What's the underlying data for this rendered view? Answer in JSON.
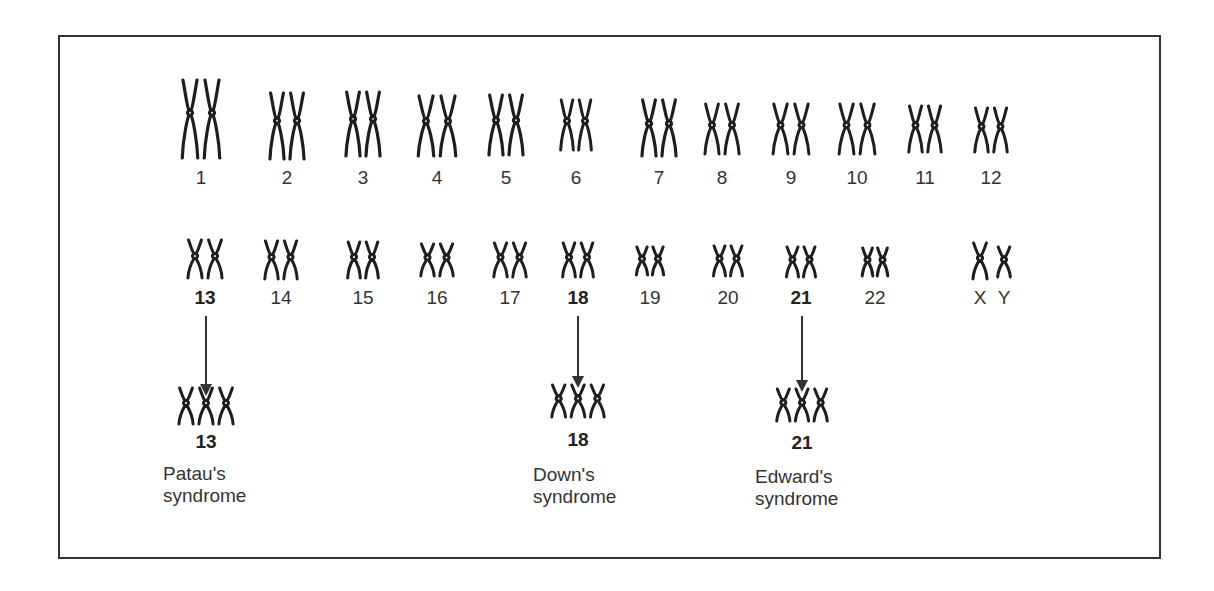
{
  "figure": {
    "row1": [
      {
        "label": "1",
        "x": 201,
        "top": 80,
        "h": 78,
        "w": 44
      },
      {
        "label": "2",
        "x": 287,
        "top": 93,
        "h": 66,
        "w": 40
      },
      {
        "label": "3",
        "x": 363,
        "top": 92,
        "h": 64,
        "w": 40
      },
      {
        "label": "4",
        "x": 437,
        "top": 96,
        "h": 60,
        "w": 44
      },
      {
        "label": "5",
        "x": 506,
        "top": 95,
        "h": 60,
        "w": 40
      },
      {
        "label": "6",
        "x": 576,
        "top": 100,
        "h": 50,
        "w": 36
      },
      {
        "label": "7",
        "x": 659,
        "top": 100,
        "h": 56,
        "w": 40
      },
      {
        "label": "8",
        "x": 722,
        "top": 104,
        "h": 50,
        "w": 40
      },
      {
        "label": "9",
        "x": 791,
        "top": 104,
        "h": 50,
        "w": 42
      },
      {
        "label": "10",
        "x": 857,
        "top": 104,
        "h": 50,
        "w": 42
      },
      {
        "label": "11",
        "x": 925,
        "top": 106,
        "h": 46,
        "w": 38
      },
      {
        "label": "12",
        "x": 991,
        "top": 108,
        "h": 44,
        "w": 38
      }
    ],
    "row1_label_y": 168,
    "row2": [
      {
        "label": "13",
        "x": 205,
        "top": 240,
        "h": 38,
        "w": 40,
        "bold": true
      },
      {
        "label": "14",
        "x": 281,
        "top": 241,
        "h": 38,
        "w": 38,
        "bold": false
      },
      {
        "label": "15",
        "x": 363,
        "top": 242,
        "h": 36,
        "w": 36,
        "bold": false
      },
      {
        "label": "16",
        "x": 437,
        "top": 244,
        "h": 32,
        "w": 38,
        "bold": false
      },
      {
        "label": "17",
        "x": 510,
        "top": 243,
        "h": 34,
        "w": 38,
        "bold": false
      },
      {
        "label": "18",
        "x": 578,
        "top": 243,
        "h": 34,
        "w": 36,
        "bold": true
      },
      {
        "label": "19",
        "x": 650,
        "top": 247,
        "h": 28,
        "w": 32,
        "bold": false
      },
      {
        "label": "20",
        "x": 728,
        "top": 246,
        "h": 30,
        "w": 34,
        "bold": false
      },
      {
        "label": "21",
        "x": 801,
        "top": 247,
        "h": 30,
        "w": 34,
        "bold": true
      },
      {
        "label": "22",
        "x": 875,
        "top": 248,
        "h": 28,
        "w": 30,
        "bold": false
      }
    ],
    "sex_chromosomes": {
      "labels": [
        "X",
        "Y"
      ],
      "x_label_x": 980,
      "y_label_x": 1004,
      "top": 243,
      "h": 36
    },
    "row2_label_y": 288,
    "trisomies": [
      {
        "label": "13",
        "x": 206,
        "arrow_top": 316,
        "arrow_h": 70,
        "chrom_top": 388,
        "h": 36,
        "w": 60,
        "label_y": 432,
        "syndrome_lines": [
          "Patau's",
          "syndrome"
        ],
        "syndrome_x": 163,
        "syndrome_y": 463
      },
      {
        "label": "18",
        "x": 578,
        "arrow_top": 316,
        "arrow_h": 62,
        "chrom_top": 385,
        "h": 32,
        "w": 58,
        "label_y": 430,
        "syndrome_lines": [
          "Down's",
          "syndrome"
        ],
        "syndrome_x": 533,
        "syndrome_y": 464
      },
      {
        "label": "21",
        "x": 802,
        "arrow_top": 316,
        "arrow_h": 66,
        "chrom_top": 389,
        "h": 32,
        "w": 56,
        "label_y": 433,
        "syndrome_lines": [
          "Edward's",
          "syndrome"
        ],
        "syndrome_x": 755,
        "syndrome_y": 466
      }
    ]
  }
}
